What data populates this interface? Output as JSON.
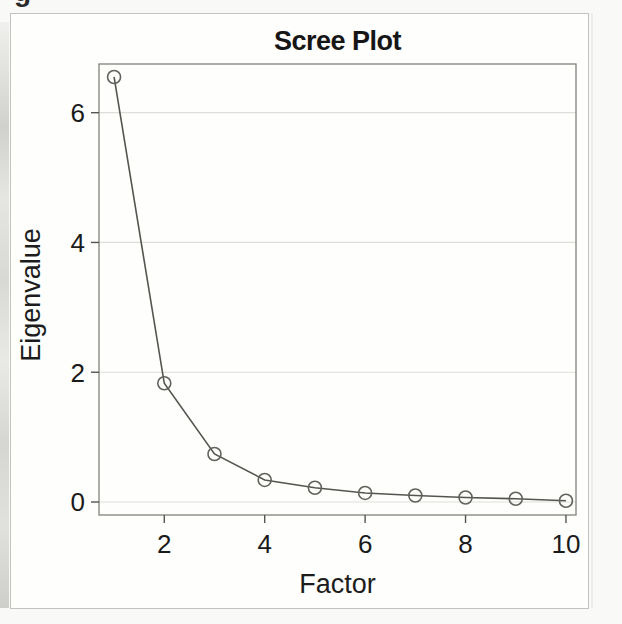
{
  "page": {
    "clipped_caption_char": "g"
  },
  "chart_data": {
    "type": "line",
    "title": "Scree Plot",
    "xlabel": "Factor",
    "ylabel": "Eigenvalue",
    "x": [
      1,
      2,
      3,
      4,
      5,
      6,
      7,
      8,
      9,
      10
    ],
    "values": [
      6.55,
      1.83,
      0.74,
      0.34,
      0.22,
      0.14,
      0.1,
      0.07,
      0.05,
      0.02
    ],
    "xticks": [
      2,
      4,
      6,
      8,
      10
    ],
    "yticks": [
      0,
      2,
      4,
      6
    ],
    "xlim": [
      0.7,
      10.2
    ],
    "ylim": [
      -0.2,
      6.75
    ],
    "grid": "horizontal-light",
    "legend": "none",
    "marker": "open-circle",
    "colors": {
      "line": "#55554f",
      "marker": "#62625c",
      "grid": "#deded9",
      "frame": "#82827c",
      "tick": "#55554f",
      "text": "#1a1a1a",
      "outer_border": "#c3c3bd",
      "page_bg": "#f9f9f7"
    }
  }
}
